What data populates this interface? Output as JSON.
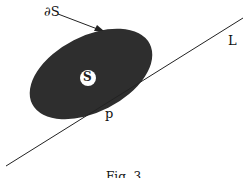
{
  "labels": {
    "boundary": "∂S",
    "line": "L",
    "point": "p",
    "set": "S",
    "caption": "Fig. 3"
  },
  "colors": {
    "fill": "#2e2e2e",
    "stroke": "#222222",
    "background": "#ffffff"
  }
}
